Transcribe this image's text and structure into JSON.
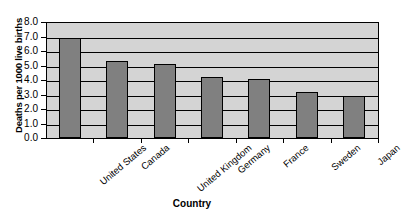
{
  "chart_data": {
    "type": "bar",
    "title": "",
    "xlabel": "Country",
    "ylabel": "Deaths per 1000 live births",
    "categories": [
      "United States",
      "Canada",
      "United Kingdom",
      "Germany",
      "France",
      "Sweden",
      "Japan"
    ],
    "values": [
      6.9,
      5.3,
      5.1,
      4.2,
      4.1,
      3.2,
      2.9
    ],
    "ylim": [
      0.0,
      8.0
    ],
    "ytick_labels": [
      "8.0",
      "7.0",
      "6.0",
      "5.0",
      "4.0",
      "3.0",
      "2.0",
      "1.0",
      "0.0"
    ],
    "ytick_values": [
      8.0,
      7.0,
      6.0,
      5.0,
      4.0,
      3.0,
      2.0,
      1.0,
      0.0
    ],
    "ytick_step": 1.0,
    "grid": true,
    "grid_orientation": "horizontal",
    "legend": false,
    "legend_position": "none",
    "series": [
      {
        "name": "Deaths per 1000 live births",
        "values": [
          6.9,
          5.3,
          5.1,
          4.2,
          4.1,
          3.2,
          2.9
        ]
      }
    ],
    "colors": {
      "bar_fill": "#808080",
      "bar_border": "#000000",
      "plot_background": "#d4d4d4",
      "gridline": "#000000",
      "axis": "#000000",
      "text": "#000000",
      "page_background": "#ffffff"
    }
  }
}
